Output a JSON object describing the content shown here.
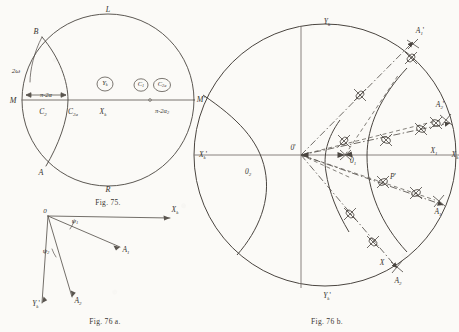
{
  "page": {
    "width": 459,
    "height": 332,
    "background": "#fbfaf7",
    "ink": "#3a3632",
    "header_left": "",
    "header_right": ""
  },
  "fig75": {
    "caption": "Fig. 75.",
    "center": {
      "x": 108,
      "y": 100
    },
    "radius": 86,
    "labels": {
      "top": "L",
      "bottom": "R",
      "left_point": "M",
      "right_point": "M'",
      "upper_arc_point": "B",
      "lower_arc_point": "A",
      "two_omega": "2ω",
      "pi_minus_2alpha": "π-2α",
      "pi_minus_2alpha_2": "π-2α",
      "pi_minus_2alpha_2_sub": "2",
      "c2": "C",
      "c2_sub": "2",
      "c2a": "C",
      "c2a_sub": "2a",
      "xk": "X",
      "xk_sub": "k",
      "circled_yk": "Y",
      "circled_yk_sub": "k",
      "circled_c1": "C",
      "circled_c1_sub": "1",
      "circled_c2a": "C",
      "circled_c2a_sub": "2a"
    }
  },
  "fig76a": {
    "caption": "Fig. 76 a.",
    "origin": {
      "x": 48,
      "y": 216
    },
    "labels": {
      "origin": "0",
      "axis_xk": "X",
      "axis_xk_sub": "k",
      "vector_a1": "A",
      "vector_a1_sub": "1",
      "vector_a2": "A",
      "vector_a2_sub": "2",
      "axis_yk": "Y",
      "axis_yk_sub": "k",
      "angle_psi_1": "ψ",
      "angle_psi_1_sub": "1",
      "angle_psi_2": "ψ",
      "angle_psi_2_sub": "2"
    }
  },
  "fig76b": {
    "caption": "Fig. 76 b.",
    "center": {
      "x": 325,
      "y": 155
    },
    "radius": 131,
    "labels": {
      "top_axis": "Y",
      "top_axis_sub": "k",
      "bottom_axis": "Y",
      "bottom_axis_sub": "k",
      "bottom_axis_prime": "'",
      "left_axis": "X",
      "left_axis_sub": "k",
      "left_axis_prime": "'",
      "right_axis": "X",
      "right_axis_sub": "1",
      "right_axis_far": "X",
      "right_axis_far_sub": "k",
      "origin": "0",
      "origin_prime": "'",
      "o1": "0",
      "o1_sub": "1",
      "o2": "0",
      "o2_sub": "2",
      "a1_prime_top": "A",
      "a1_prime_top_sub": "1",
      "a2_prime_right": "A",
      "a2_prime_right_sub": "2",
      "a1_right": "A",
      "a1_right_sub": "1",
      "a2_bottom": "A",
      "a2_bottom_sub": "2",
      "p_prime": "P",
      "p_prime_mark": "'",
      "x_mark": "X"
    },
    "tick_marks": 8
  }
}
